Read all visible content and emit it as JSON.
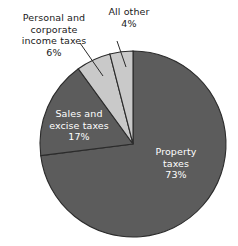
{
  "chart_data": {
    "type": "pie",
    "title": "",
    "subtitle": "",
    "xlabel": "",
    "ylabel": "",
    "legend_position": "none",
    "grid": false,
    "units": "percent",
    "start_angle_deg": 0,
    "direction": "clockwise",
    "categories": [
      "Property taxes",
      "Sales and excise taxes",
      "Personal and corporate income taxes",
      "All other"
    ],
    "values": [
      73,
      17,
      6,
      4
    ],
    "slices": [
      {
        "name": "Property taxes",
        "value": 73,
        "value_label": "73%",
        "label_text": "Property\ntaxes\n73%",
        "color": "#5c5c5c",
        "label_placement": "inside",
        "label_color": "#ffffff"
      },
      {
        "name": "Sales and excise taxes",
        "value": 17,
        "value_label": "17%",
        "label_text": "Sales and\nexcise taxes\n17%",
        "color": "#5c5c5c",
        "label_placement": "inside",
        "label_color": "#ffffff"
      },
      {
        "name": "Personal and corporate income taxes",
        "value": 6,
        "value_label": "6%",
        "label_text": "Personal and\ncorporate\nincome taxes\n6%",
        "color": "#c9c9c9",
        "label_placement": "outside-leader",
        "label_color": "#1a1a1a"
      },
      {
        "name": "All other",
        "value": 4,
        "value_label": "4%",
        "label_text": "All other\n4%",
        "color": "#c9c9c9",
        "label_placement": "outside-leader",
        "label_color": "#1a1a1a"
      }
    ],
    "colors": {
      "dark_slice": "#5c5c5c",
      "light_slice": "#c9c9c9",
      "outline": "#2b2b2b",
      "background": "#ffffff",
      "inside_label": "#ffffff",
      "outside_label": "#1a1a1a"
    },
    "geometry": {
      "center_x": 133,
      "center_y": 144,
      "radius": 93
    }
  }
}
